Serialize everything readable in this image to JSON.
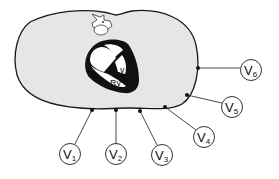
{
  "diagram": {
    "colors": {
      "body_fill": "#e6e6e6",
      "outline": "#1a1a1a",
      "heart": "#111111",
      "background": "#ffffff"
    },
    "heart_labels": {
      "lv": "Lv",
      "rv": "Rv"
    },
    "leads": [
      {
        "id": "V1",
        "letter": "V",
        "num": "1"
      },
      {
        "id": "V2",
        "letter": "V",
        "num": "2"
      },
      {
        "id": "V3",
        "letter": "V",
        "num": "3"
      },
      {
        "id": "V4",
        "letter": "V",
        "num": "4"
      },
      {
        "id": "V5",
        "letter": "V",
        "num": "5"
      },
      {
        "id": "V6",
        "letter": "V",
        "num": "6"
      }
    ]
  }
}
